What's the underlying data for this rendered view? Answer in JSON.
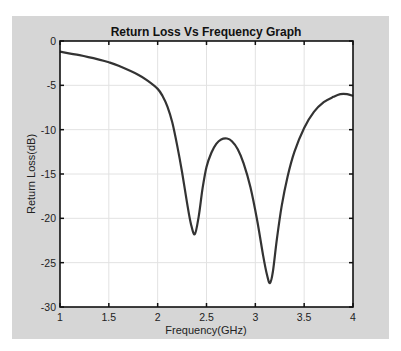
{
  "chart_data": {
    "type": "line",
    "title": "Return Loss Vs Frequency Graph",
    "xlabel": "Frequency(GHz)",
    "ylabel": "Return Loss(dB)",
    "xlim": [
      1,
      4
    ],
    "ylim": [
      -30,
      0
    ],
    "xticks": [
      1,
      1.5,
      2,
      2.5,
      3,
      3.5,
      4
    ],
    "xtick_labels": [
      "1",
      "1.5",
      "2",
      "2.5",
      "3",
      "3.5",
      "4"
    ],
    "yticks": [
      0,
      -5,
      -10,
      -15,
      -20,
      -25,
      -30
    ],
    "ytick_labels": [
      "0",
      "-5",
      "-10",
      "-15",
      "-20",
      "-25",
      "-30"
    ],
    "grid": true,
    "legend": null,
    "series": [
      {
        "name": "Return Loss",
        "color": "#333333",
        "x": [
          1.0,
          1.2,
          1.4,
          1.5,
          1.6,
          1.8,
          1.9,
          2.0,
          2.05,
          2.1,
          2.15,
          2.2,
          2.25,
          2.3,
          2.34,
          2.38,
          2.42,
          2.46,
          2.5,
          2.55,
          2.6,
          2.65,
          2.71,
          2.76,
          2.82,
          2.88,
          2.95,
          3.02,
          3.08,
          3.12,
          3.15,
          3.18,
          3.22,
          3.27,
          3.33,
          3.4,
          3.5,
          3.6,
          3.7,
          3.8,
          3.87,
          3.94,
          4.0
        ],
        "y": [
          -1.2,
          -1.6,
          -2.1,
          -2.4,
          -2.8,
          -3.8,
          -4.5,
          -5.4,
          -6.2,
          -7.4,
          -9.2,
          -11.8,
          -14.8,
          -18.2,
          -20.6,
          -21.8,
          -19.8,
          -16.6,
          -14.2,
          -12.6,
          -11.6,
          -11.1,
          -11.0,
          -11.3,
          -12.2,
          -13.8,
          -16.5,
          -20.3,
          -24.2,
          -26.4,
          -27.3,
          -26.0,
          -22.4,
          -18.6,
          -15.3,
          -12.5,
          -9.8,
          -8.0,
          -6.9,
          -6.3,
          -6.0,
          -6.0,
          -6.2
        ]
      }
    ]
  },
  "figure": {
    "background": "#d6d6d6",
    "plot_background": "#ffffff",
    "grid_color": "#e2e2e2",
    "axes_color": "#111111"
  }
}
